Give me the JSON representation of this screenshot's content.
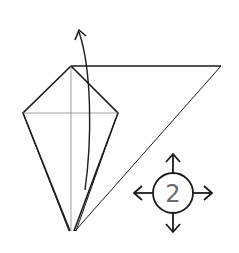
{
  "diagram": {
    "type": "origami-fold-diagram",
    "step_indicator": {
      "label": "2",
      "shape": "circle",
      "arrows": [
        "up",
        "down",
        "left",
        "right"
      ]
    },
    "elements": {
      "kite": {
        "description": "kite-shaped base with vertical and horizontal crease lines",
        "vertices": {
          "top": [
            71,
            66
          ],
          "left": [
            23,
            113
          ],
          "right": [
            118,
            113
          ],
          "bottom": [
            72,
            231
          ]
        }
      },
      "flap_triangle": {
        "description": "large triangular flap extending to the right",
        "vertices": {
          "apex": [
            71,
            66
          ],
          "right": [
            221,
            66
          ],
          "bottom": [
            75,
            231
          ]
        }
      },
      "fold_arrow": {
        "description": "curved arrow indicating flap to fold upward",
        "icon": "curved-arrow-up"
      }
    },
    "colors": {
      "line": "#1a1a1a",
      "crease": "#666666",
      "number": "#6b6b6b",
      "background": "#ffffff"
    }
  }
}
